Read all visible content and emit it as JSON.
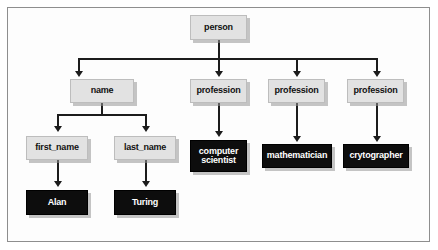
{
  "diagram": {
    "type": "tree",
    "colors": {
      "frame_border": "#8e8e8e",
      "canvas_background": "#fdfdfd",
      "light_node_fill": "#e2e2e2",
      "light_node_text": "#111111",
      "dark_node_fill": "#0d0d0d",
      "dark_node_text": "#ffffff",
      "connector": "#1c1c1c",
      "shadow": "#969696"
    },
    "nodes": {
      "root": {
        "label": "person",
        "style": "light"
      },
      "name": {
        "label": "name",
        "style": "light"
      },
      "profession_1": {
        "label": "profession",
        "style": "light"
      },
      "profession_2": {
        "label": "profession",
        "style": "light"
      },
      "profession_3": {
        "label": "profession",
        "style": "light"
      },
      "first_name": {
        "label": "first_name",
        "style": "light"
      },
      "last_name": {
        "label": "last_name",
        "style": "light"
      },
      "value_first_name": {
        "label": "Alan",
        "style": "dark"
      },
      "value_last_name": {
        "label": "Turing",
        "style": "dark"
      },
      "value_profession_1": {
        "label": "computer\nscientist",
        "style": "dark"
      },
      "value_profession_2": {
        "label": "mathematician",
        "style": "dark"
      },
      "value_profession_3": {
        "label": "crytographer",
        "style": "dark"
      }
    },
    "edges": [
      {
        "from": "person",
        "to": "name"
      },
      {
        "from": "person",
        "to": "profession"
      },
      {
        "from": "person",
        "to": "profession"
      },
      {
        "from": "person",
        "to": "profession"
      },
      {
        "from": "name",
        "to": "first_name"
      },
      {
        "from": "name",
        "to": "last_name"
      },
      {
        "from": "first_name",
        "to": "Alan"
      },
      {
        "from": "last_name",
        "to": "Turing"
      },
      {
        "from": "profession",
        "to": "computer scientist"
      },
      {
        "from": "profession",
        "to": "mathematician"
      },
      {
        "from": "profession",
        "to": "crytographer"
      }
    ]
  }
}
